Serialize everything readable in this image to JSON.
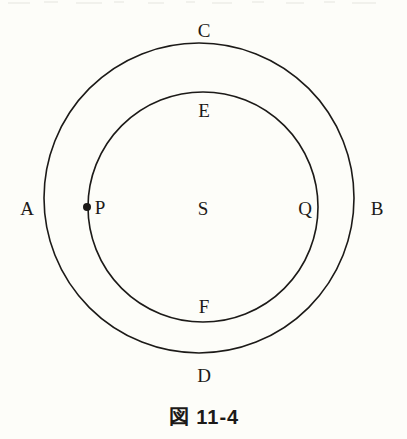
{
  "figure": {
    "caption": "図 11-4",
    "background_color": "#fdfdf9",
    "stroke_color": "#1c1a18"
  },
  "chart_data": {
    "type": "diagram",
    "title": "図 11-4",
    "shapes": [
      {
        "name": "outer-circle",
        "kind": "circle",
        "cx": 199,
        "cy": 198,
        "r": 155,
        "stroke": "#1c1a18",
        "stroke_width": 1.6,
        "fill": "none"
      },
      {
        "name": "inner-circle",
        "kind": "circle",
        "cx": 203,
        "cy": 207,
        "r": 115,
        "stroke": "#1c1a18",
        "stroke_width": 1.6,
        "fill": "none"
      },
      {
        "name": "point-p-dot",
        "kind": "dot",
        "cx": 87,
        "cy": 207,
        "r": 4,
        "fill": "#1c1a18"
      }
    ],
    "labels": [
      {
        "text": "A",
        "x": 27,
        "y": 208,
        "belongs_to": "outer-circle",
        "position": "left-outside"
      },
      {
        "text": "B",
        "x": 377,
        "y": 208,
        "belongs_to": "outer-circle",
        "position": "right-outside"
      },
      {
        "text": "C",
        "x": 204,
        "y": 30,
        "belongs_to": "outer-circle",
        "position": "top-outside"
      },
      {
        "text": "D",
        "x": 204,
        "y": 375,
        "belongs_to": "outer-circle",
        "position": "bottom-outside"
      },
      {
        "text": "E",
        "x": 204,
        "y": 110,
        "belongs_to": "inner-circle",
        "position": "top-inside"
      },
      {
        "text": "F",
        "x": 204,
        "y": 306,
        "belongs_to": "inner-circle",
        "position": "bottom-inside"
      },
      {
        "text": "P",
        "x": 100,
        "y": 207,
        "belongs_to": "inner-circle",
        "position": "left-inside"
      },
      {
        "text": "Q",
        "x": 305,
        "y": 208,
        "belongs_to": "inner-circle",
        "position": "right-inside"
      },
      {
        "text": "S",
        "x": 203,
        "y": 208,
        "belongs_to": "center",
        "position": "center"
      }
    ]
  }
}
